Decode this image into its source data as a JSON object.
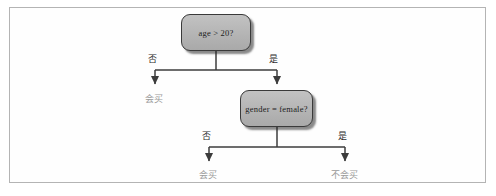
{
  "figure": {
    "kind": "decision-tree-diagram",
    "border_color": "#b4b4b4",
    "background_color": "#ffffff"
  },
  "diagram": {
    "node_fill_color": "#b9b9b9",
    "node_border_color": "#3a3a3a",
    "edge_color": "#3c3c3c",
    "leaf_text_color": "#9a9a9a",
    "edge_text_color": "#2b2b2b",
    "nodes": [
      {
        "id": "root",
        "label": "age > 20?",
        "type": "decision"
      },
      {
        "id": "gender",
        "label": "gender = female?",
        "type": "decision"
      }
    ],
    "edges": [
      {
        "from": "root",
        "to": "leaf_buy_left",
        "label": "否"
      },
      {
        "from": "root",
        "to": "gender",
        "label": "是"
      },
      {
        "from": "gender",
        "to": "leaf_buy_bottom",
        "label": "否"
      },
      {
        "from": "gender",
        "to": "leaf_nobuy",
        "label": "是"
      }
    ],
    "leaves": [
      {
        "id": "leaf_buy_left",
        "label": "会买"
      },
      {
        "id": "leaf_buy_bottom",
        "label": "会买"
      },
      {
        "id": "leaf_nobuy",
        "label": "不会买"
      }
    ]
  }
}
